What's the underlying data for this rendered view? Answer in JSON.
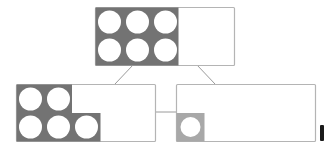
{
  "diagram": {
    "type": "number-bond-ten-frames",
    "colors": {
      "frame_border": "#b4b4b4",
      "filled_region": "#737373",
      "filled_region_light": "#a8a8a8",
      "counter": "#ffffff",
      "connector": "#9a9a9a",
      "background": "#ffffff",
      "edge_mark": "#1a1a1a"
    },
    "whole": {
      "label": "whole",
      "count": 6,
      "frame_columns": 3,
      "frame_rows": 2,
      "layout": [
        [
          1,
          1,
          1
        ],
        [
          1,
          1,
          1
        ]
      ]
    },
    "parts": [
      {
        "label": "part-left",
        "count": 5,
        "layout": [
          [
            1,
            1,
            0
          ],
          [
            1,
            1,
            1
          ]
        ]
      },
      {
        "label": "part-right",
        "count": 1,
        "layout": [
          [
            0
          ],
          [
            1
          ]
        ],
        "style": "light"
      }
    ]
  }
}
